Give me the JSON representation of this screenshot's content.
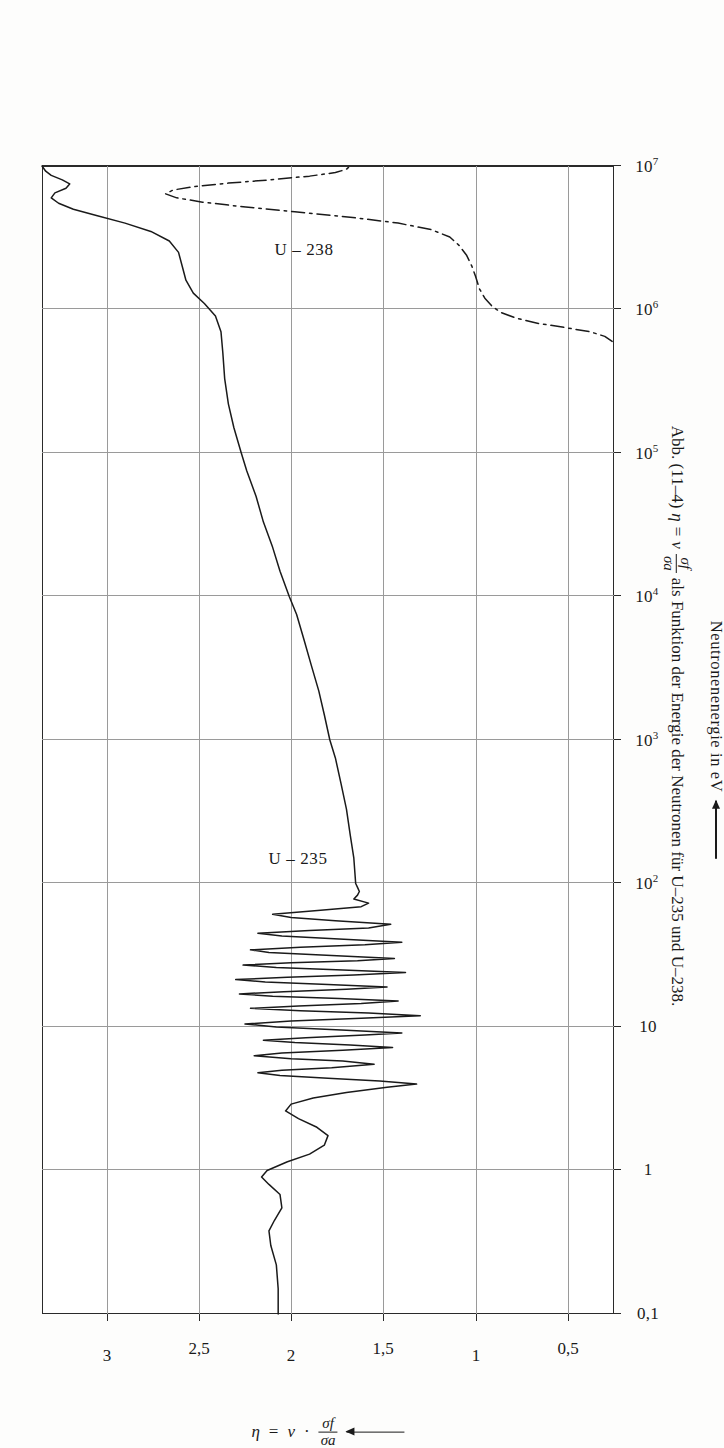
{
  "figure": {
    "caption_prefix": "Abb. (11–4)",
    "caption_eta": "η",
    "caption_eq": "=",
    "caption_nu": "ν",
    "caption_frac_num": "σf",
    "caption_frac_den": "σa",
    "caption_rest": "als Funktion der Energie der Neutronen für U–235 und U–238."
  },
  "axes": {
    "x": {
      "label": "Neutronenenergie in eV",
      "scale": "log",
      "min": 0.1,
      "max": 10000000,
      "tick_labels": [
        "0,1",
        "1",
        "10",
        "10",
        "10",
        "10",
        "10",
        "10",
        "10"
      ],
      "tick_exponents": [
        "",
        "",
        "",
        "2",
        "3",
        "4",
        "5",
        "6",
        "7"
      ],
      "tick_values": [
        0.1,
        1,
        10,
        100,
        1000,
        10000,
        100000,
        1000000,
        10000000
      ]
    },
    "y": {
      "label_eta": "η",
      "label_eq": "=",
      "label_nu": "ν",
      "label_dot": "·",
      "label_frac_num": "σf",
      "label_frac_den": "σa",
      "min": 0.25,
      "max": 3.35,
      "tick_labels": [
        "0,5",
        "1",
        "1,5",
        "2",
        "2,5",
        "3"
      ],
      "tick_values": [
        0.5,
        1,
        1.5,
        2,
        2.5,
        3
      ]
    }
  },
  "chart_data": {
    "type": "line",
    "xlabel": "Neutronenenergie in eV",
    "ylabel": "η = ν · σf/σa",
    "xscale": "log",
    "xlim": [
      0.1,
      10000000
    ],
    "ylim": [
      0.25,
      3.35
    ],
    "grid": true,
    "legend": "inline-annotations",
    "series": [
      {
        "name": "U-235",
        "linestyle": "solid",
        "color": "#1a1a1a",
        "annotation": "U – 235",
        "points": [
          [
            0.1,
            2.07
          ],
          [
            0.15,
            2.07
          ],
          [
            0.22,
            2.08
          ],
          [
            0.3,
            2.11
          ],
          [
            0.38,
            2.12
          ],
          [
            0.45,
            2.09
          ],
          [
            0.55,
            2.05
          ],
          [
            0.68,
            2.06
          ],
          [
            0.8,
            2.12
          ],
          [
            0.9,
            2.16
          ],
          [
            1.0,
            2.13
          ],
          [
            1.15,
            2.02
          ],
          [
            1.3,
            1.9
          ],
          [
            1.5,
            1.82
          ],
          [
            1.75,
            1.8
          ],
          [
            2.0,
            1.86
          ],
          [
            2.3,
            1.96
          ],
          [
            2.6,
            2.03
          ],
          [
            2.9,
            2.0
          ],
          [
            3.2,
            1.88
          ],
          [
            3.5,
            1.7
          ],
          [
            3.8,
            1.48
          ],
          [
            4.0,
            1.32
          ],
          [
            4.2,
            1.52
          ],
          [
            4.4,
            1.8
          ],
          [
            4.6,
            2.06
          ],
          [
            4.8,
            2.18
          ],
          [
            5.0,
            2.05
          ],
          [
            5.2,
            1.78
          ],
          [
            5.5,
            1.55
          ],
          [
            5.8,
            1.72
          ],
          [
            6.0,
            2.0
          ],
          [
            6.3,
            2.2
          ],
          [
            6.6,
            2.05
          ],
          [
            6.9,
            1.72
          ],
          [
            7.2,
            1.45
          ],
          [
            7.5,
            1.68
          ],
          [
            7.8,
            1.98
          ],
          [
            8.1,
            2.15
          ],
          [
            8.4,
            1.92
          ],
          [
            8.8,
            1.6
          ],
          [
            9.1,
            1.4
          ],
          [
            9.5,
            1.7
          ],
          [
            10.0,
            2.08
          ],
          [
            10.5,
            2.25
          ],
          [
            11.0,
            2.0
          ],
          [
            11.5,
            1.62
          ],
          [
            12.0,
            1.3
          ],
          [
            12.5,
            1.58
          ],
          [
            13.0,
            1.95
          ],
          [
            13.5,
            2.22
          ],
          [
            14.0,
            1.96
          ],
          [
            14.6,
            1.62
          ],
          [
            15.2,
            1.42
          ],
          [
            15.8,
            1.74
          ],
          [
            16.4,
            2.1
          ],
          [
            17.0,
            2.28
          ],
          [
            17.6,
            2.04
          ],
          [
            18.3,
            1.7
          ],
          [
            19.0,
            1.48
          ],
          [
            19.8,
            1.8
          ],
          [
            20.6,
            2.14
          ],
          [
            21.4,
            2.3
          ],
          [
            22.2,
            2.02
          ],
          [
            23.0,
            1.66
          ],
          [
            24.0,
            1.38
          ],
          [
            25.0,
            1.72
          ],
          [
            26.0,
            2.08
          ],
          [
            27.0,
            2.26
          ],
          [
            28.0,
            2.0
          ],
          [
            29.0,
            1.64
          ],
          [
            30.0,
            1.44
          ],
          [
            31.5,
            1.78
          ],
          [
            33.0,
            2.12
          ],
          [
            34.5,
            2.22
          ],
          [
            36.0,
            1.95
          ],
          [
            37.5,
            1.6
          ],
          [
            39.0,
            1.4
          ],
          [
            41.0,
            1.74
          ],
          [
            43.0,
            2.05
          ],
          [
            45.0,
            2.18
          ],
          [
            47.0,
            1.9
          ],
          [
            49.0,
            1.58
          ],
          [
            52.0,
            1.46
          ],
          [
            55.0,
            1.76
          ],
          [
            58.0,
            2.0
          ],
          [
            61.0,
            2.1
          ],
          [
            65.0,
            1.84
          ],
          [
            69.0,
            1.62
          ],
          [
            73.0,
            1.58
          ],
          [
            78.0,
            1.66
          ],
          [
            83.0,
            1.64
          ],
          [
            88.0,
            1.63
          ],
          [
            94.0,
            1.64
          ],
          [
            100.0,
            1.65
          ],
          [
            150,
            1.66
          ],
          [
            220,
            1.68
          ],
          [
            330,
            1.7
          ],
          [
            500,
            1.73
          ],
          [
            750,
            1.76
          ],
          [
            1000,
            1.79
          ],
          [
            1500,
            1.82
          ],
          [
            2200,
            1.85
          ],
          [
            3300,
            1.89
          ],
          [
            5000,
            1.93
          ],
          [
            7500,
            1.97
          ],
          [
            10000,
            2.01
          ],
          [
            15000,
            2.06
          ],
          [
            22000,
            2.1
          ],
          [
            33000,
            2.15
          ],
          [
            50000,
            2.19
          ],
          [
            75000,
            2.24
          ],
          [
            100000,
            2.27
          ],
          [
            150000,
            2.31
          ],
          [
            220000,
            2.34
          ],
          [
            330000,
            2.36
          ],
          [
            500000,
            2.37
          ],
          [
            700000,
            2.38
          ],
          [
            900000,
            2.41
          ],
          [
            1100000,
            2.47
          ],
          [
            1300000,
            2.53
          ],
          [
            1600000,
            2.57
          ],
          [
            2000000,
            2.59
          ],
          [
            2500000,
            2.61
          ],
          [
            3000000,
            2.66
          ],
          [
            3500000,
            2.76
          ],
          [
            4000000,
            2.9
          ],
          [
            4500000,
            3.05
          ],
          [
            5000000,
            3.18
          ],
          [
            5500000,
            3.26
          ],
          [
            6000000,
            3.3
          ],
          [
            6500000,
            3.28
          ],
          [
            7000000,
            3.22
          ],
          [
            7500000,
            3.2
          ],
          [
            8000000,
            3.24
          ],
          [
            8600000,
            3.3
          ],
          [
            9200000,
            3.33
          ],
          [
            10000000,
            3.35
          ]
        ]
      },
      {
        "name": "U-238",
        "linestyle": "dash-dot",
        "color": "#1a1a1a",
        "annotation": "U – 238",
        "points": [
          [
            600000,
            0.26
          ],
          [
            650000,
            0.3
          ],
          [
            700000,
            0.38
          ],
          [
            750000,
            0.52
          ],
          [
            800000,
            0.66
          ],
          [
            870000,
            0.78
          ],
          [
            950000,
            0.86
          ],
          [
            1050000,
            0.91
          ],
          [
            1200000,
            0.95
          ],
          [
            1400000,
            0.98
          ],
          [
            1700000,
            1.0
          ],
          [
            2000000,
            1.02
          ],
          [
            2400000,
            1.05
          ],
          [
            2800000,
            1.09
          ],
          [
            3200000,
            1.14
          ],
          [
            3600000,
            1.24
          ],
          [
            4000000,
            1.42
          ],
          [
            4400000,
            1.68
          ],
          [
            4800000,
            1.98
          ],
          [
            5200000,
            2.26
          ],
          [
            5600000,
            2.48
          ],
          [
            6000000,
            2.62
          ],
          [
            6400000,
            2.68
          ],
          [
            6800000,
            2.64
          ],
          [
            7200000,
            2.52
          ],
          [
            7600000,
            2.34
          ],
          [
            8000000,
            2.12
          ],
          [
            8500000,
            1.9
          ],
          [
            9000000,
            1.76
          ],
          [
            9500000,
            1.7
          ],
          [
            10000000,
            1.68
          ]
        ]
      }
    ]
  }
}
